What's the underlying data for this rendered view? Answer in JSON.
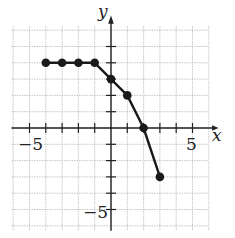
{
  "chart_data": {
    "type": "line",
    "title": "",
    "xlabel": "x",
    "ylabel": "y",
    "xlim": [
      -6,
      6
    ],
    "ylim": [
      -6,
      6
    ],
    "grid": true,
    "x_tick_labels": [
      {
        "value": -5,
        "label": "−5"
      },
      {
        "value": 5,
        "label": "5"
      }
    ],
    "y_tick_labels": [
      {
        "value": -5,
        "label": "−5"
      }
    ],
    "series": [
      {
        "name": "piecewise",
        "points": [
          [
            -4,
            4
          ],
          [
            -3,
            4
          ],
          [
            -2,
            4
          ],
          [
            -1,
            4
          ],
          [
            0,
            3
          ],
          [
            1,
            2
          ],
          [
            2,
            0
          ],
          [
            3,
            -3
          ]
        ],
        "marker": "filled-circle"
      }
    ]
  },
  "axes": {
    "x_label": "x",
    "y_label": "y",
    "x_minus5": "−5",
    "x_5": "5",
    "y_minus5": "−5"
  },
  "colors": {
    "line": "#1a1a1a",
    "grid": "#b8b8b8",
    "axis": "#222222"
  }
}
